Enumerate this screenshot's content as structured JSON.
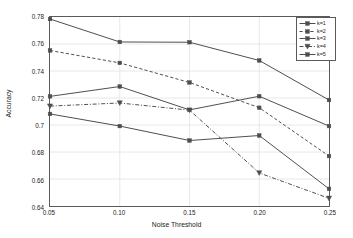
{
  "chart_data": {
    "type": "line",
    "title": "",
    "xlabel": "Noise Threshold",
    "ylabel": "Accuracy",
    "x": [
      0.05,
      0.1,
      0.15,
      0.2,
      0.25
    ],
    "xtick_labels": [
      "0.05",
      "0.10",
      "0.15",
      "0.20",
      "0.25"
    ],
    "ytick_labels": [
      "0.64",
      "0.66",
      "0.68",
      "0.7",
      "0.72",
      "0.74",
      "0.76",
      "0.78"
    ],
    "ytick_values": [
      0.64,
      0.66,
      0.68,
      0.7,
      0.72,
      0.74,
      0.76,
      0.78
    ],
    "xlim": [
      0.05,
      0.25
    ],
    "ylim": [
      0.64,
      0.78
    ],
    "grid": true,
    "legend_position": "top-right",
    "series": [
      {
        "name": "k=1",
        "values": [
          0.7785,
          0.7615,
          0.7613,
          0.7478,
          0.7185
        ],
        "line_style": "solid",
        "marker": "square",
        "color": "#4d4d4d"
      },
      {
        "name": "k=2",
        "values": [
          0.7552,
          0.746,
          0.7315,
          0.7128,
          0.677
        ],
        "line_style": "dashed",
        "marker": "square",
        "color": "#4d4d4d"
      },
      {
        "name": "k=3",
        "values": [
          0.7212,
          0.7285,
          0.7112,
          0.7213,
          0.6992
        ],
        "line_style": "solid",
        "marker": "square",
        "color": "#4d4d4d"
      },
      {
        "name": "k=4",
        "values": [
          0.714,
          0.7163,
          0.711,
          0.6645,
          0.6457
        ],
        "line_style": "dashdot",
        "marker": "triangle-down",
        "color": "#4d4d4d"
      },
      {
        "name": "k=5",
        "values": [
          0.7082,
          0.6992,
          0.6885,
          0.6922,
          0.6527
        ],
        "line_style": "solid",
        "marker": "square",
        "color": "#4d4d4d"
      }
    ]
  },
  "axes": {
    "frame_color": "#5a5a5a",
    "grid_color": "#e2e2e2",
    "background": "#ffffff"
  }
}
